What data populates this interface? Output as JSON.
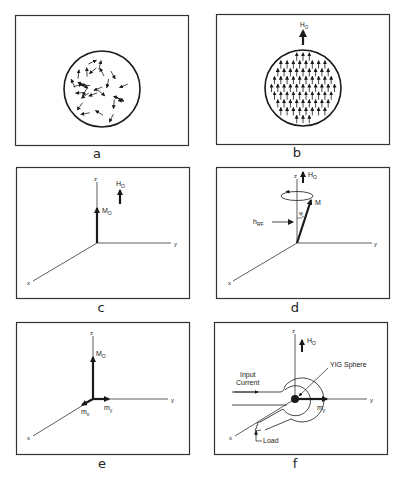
{
  "figure": {
    "panels": [
      {
        "id": "a",
        "label": "a",
        "description": "Sphere with randomly oriented magnetic moments (no applied field)"
      },
      {
        "id": "b",
        "label": "b",
        "description": "Sphere with moments aligned by applied field",
        "field_label": "H",
        "field_sub": "O"
      },
      {
        "id": "c",
        "label": "c",
        "axes": {
          "x": "x",
          "y": "y",
          "z": "z"
        },
        "vector_label": "M",
        "vector_sub": "O",
        "field_label": "H",
        "field_sub": "O"
      },
      {
        "id": "d",
        "label": "d",
        "axes": {
          "x": "x",
          "y": "y",
          "z": "z"
        },
        "field_label": "H",
        "field_sub": "O",
        "vector_label": "M",
        "angle_label": "φ",
        "rf_label": "h",
        "rf_sub": "RF"
      },
      {
        "id": "e",
        "label": "e",
        "axes": {
          "x": "x",
          "y": "y",
          "z": "z"
        },
        "vector_label": "M",
        "vector_sub": "O",
        "mx_label": "m",
        "mx_sub": "x",
        "my_label": "m",
        "my_sub": "y"
      },
      {
        "id": "f",
        "label": "f",
        "axes": {
          "x": "x",
          "y": "y",
          "z": "z"
        },
        "field_label": "H",
        "field_sub": "O",
        "sphere_label": "YIG Sphere",
        "input_label_1": "Input",
        "input_label_2": "Current",
        "load_label": "Load",
        "my_label": "m",
        "my_sub": "y"
      }
    ]
  },
  "colors": {
    "ink": "#1a1a1a",
    "frame": "#333333",
    "background": "#ffffff"
  }
}
